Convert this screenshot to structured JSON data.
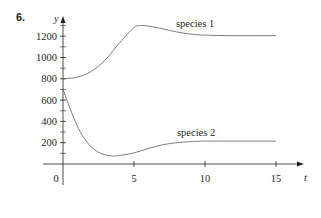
{
  "problem_number": "6.",
  "chart_data": {
    "type": "line",
    "title": "",
    "xlabel": "t",
    "ylabel": "y",
    "xlim": [
      0,
      16
    ],
    "ylim": [
      0,
      1350
    ],
    "grid": false,
    "x_ticks": [
      0,
      5,
      10,
      15
    ],
    "x_tick_labels": [
      "0",
      "5",
      "10",
      "15"
    ],
    "y_ticks": [
      200,
      400,
      600,
      800,
      1000,
      1200
    ],
    "y_tick_labels": [
      "200",
      "400",
      "600",
      "800",
      "1000",
      "1200"
    ],
    "y_minor_ticks": [
      100,
      300,
      500,
      700,
      900,
      1100,
      1300
    ],
    "series": [
      {
        "name": "species 1",
        "x": [
          0,
          1,
          2,
          3,
          4,
          5,
          5.5,
          6,
          7,
          8,
          9,
          10,
          12,
          15
        ],
        "values": [
          800,
          815,
          870,
          980,
          1140,
          1280,
          1300,
          1295,
          1270,
          1240,
          1220,
          1210,
          1205,
          1205
        ]
      },
      {
        "name": "species 2",
        "x": [
          0,
          0.5,
          1,
          1.5,
          2,
          2.5,
          3,
          3.5,
          4,
          5,
          6,
          7,
          8,
          9,
          10,
          12,
          15
        ],
        "values": [
          700,
          520,
          360,
          240,
          160,
          110,
          85,
          75,
          80,
          105,
          145,
          180,
          200,
          210,
          215,
          215,
          215
        ]
      }
    ],
    "annotations": [
      {
        "text": "species 1",
        "near_x": 9.5,
        "near_y": 1330
      },
      {
        "text": "species 2",
        "near_x": 9.5,
        "near_y": 290
      }
    ],
    "legend": "inline labels"
  }
}
